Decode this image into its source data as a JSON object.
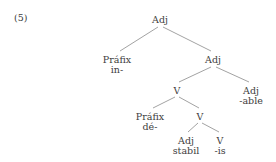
{
  "example": {
    "number": "(5)"
  },
  "diagram": {
    "kind": "morphological-tree",
    "nodes": [
      {
        "id": "root",
        "cat": "Adj",
        "form": "",
        "x": 160,
        "y": 15
      },
      {
        "id": "prefix-in",
        "cat": "Práfix",
        "form": "in-",
        "x": 117,
        "y": 55
      },
      {
        "id": "adj-2",
        "cat": "Adj",
        "form": "",
        "x": 213,
        "y": 55
      },
      {
        "id": "v-1",
        "cat": "V",
        "form": "",
        "x": 177,
        "y": 86
      },
      {
        "id": "adj-able",
        "cat": "Adj",
        "form": "-able",
        "x": 251,
        "y": 86
      },
      {
        "id": "prefix-de",
        "cat": "Práfix",
        "form": "dé-",
        "x": 150,
        "y": 112
      },
      {
        "id": "v-2",
        "cat": "V",
        "form": "",
        "x": 200,
        "y": 112
      },
      {
        "id": "adj-stabil",
        "cat": "Adj",
        "form": "stabil",
        "x": 186,
        "y": 136
      },
      {
        "id": "v-is",
        "cat": "V",
        "form": "-is",
        "x": 220,
        "y": 136
      }
    ],
    "edges": [
      {
        "from": "root",
        "to": "prefix-in",
        "x1": 158,
        "y1": 27,
        "x2": 120,
        "y2": 51
      },
      {
        "from": "root",
        "to": "adj-2",
        "x1": 163,
        "y1": 27,
        "x2": 211,
        "y2": 51
      },
      {
        "from": "adj-2",
        "to": "v-1",
        "x1": 211,
        "y1": 67,
        "x2": 179,
        "y2": 82
      },
      {
        "from": "adj-2",
        "to": "adj-able",
        "x1": 216,
        "y1": 67,
        "x2": 249,
        "y2": 82
      },
      {
        "from": "v-1",
        "to": "prefix-de",
        "x1": 175,
        "y1": 97,
        "x2": 153,
        "y2": 108
      },
      {
        "from": "v-1",
        "to": "v-2",
        "x1": 179,
        "y1": 97,
        "x2": 199,
        "y2": 108
      },
      {
        "from": "v-2",
        "to": "adj-stabil",
        "x1": 198,
        "y1": 123,
        "x2": 188,
        "y2": 132
      },
      {
        "from": "v-2",
        "to": "v-is",
        "x1": 202,
        "y1": 123,
        "x2": 219,
        "y2": 132
      }
    ],
    "style": {
      "line_color": "#8a8a8a",
      "text_color": "#3d3d3d",
      "background": "#ffffff"
    }
  }
}
